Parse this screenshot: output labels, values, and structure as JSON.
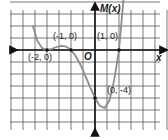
{
  "chart_data": {
    "type": "line",
    "title": "",
    "xlabel": "x",
    "ylabel": "M(x)",
    "origin_label": "O",
    "grid": true,
    "grid_spacing_units": {
      "x": 0.5,
      "y": 1
    },
    "xlim": [
      -4,
      3
    ],
    "ylim": [
      -7,
      4
    ],
    "labeled_points": [
      {
        "label": "(-2, 0)",
        "x": -2,
        "y": 0
      },
      {
        "label": "(-1, 0)",
        "x": -1,
        "y": 0
      },
      {
        "label": "(1, 0)",
        "x": 1,
        "y": 0
      },
      {
        "label": "(0, -4)",
        "x": 0,
        "y": -4
      }
    ],
    "series": [
      {
        "name": "M(x)",
        "color": "#8c8c8c",
        "fitted": true,
        "fit_note": "Curve sampled from a quartic fitted to pass through the four labeled points; the exact function is not stated in the image.",
        "fitted_expression": "(x+2)^2 (x^2 - 1)",
        "x": [
          -2.6,
          -2.4,
          -2.2,
          -2.0,
          -1.8,
          -1.6,
          -1.4,
          -1.2,
          -1.0,
          -0.8,
          -0.6,
          -0.4,
          -0.2,
          0.0,
          0.2,
          0.4,
          0.6,
          0.8,
          1.0,
          1.2,
          1.4,
          1.5
        ],
        "values": [
          2.06,
          0.76,
          0.15,
          0.0,
          0.09,
          0.25,
          0.35,
          0.28,
          0.0,
          -0.52,
          -1.25,
          -2.15,
          -3.11,
          -4.0,
          -4.66,
          -4.84,
          -4.22,
          -2.52,
          0.0,
          4.5,
          11.2,
          15.31
        ]
      }
    ],
    "axis_color": "#111111",
    "grid_color": "#555555"
  }
}
